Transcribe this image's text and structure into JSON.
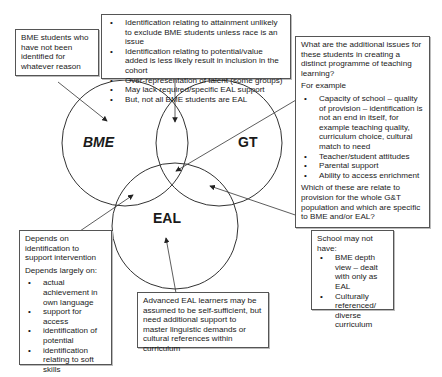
{
  "venn": {
    "circles": [
      {
        "id": "bme",
        "label": "BME",
        "italic": true
      },
      {
        "id": "gt",
        "label": "GT",
        "italic": false
      },
      {
        "id": "eal",
        "label": "EAL",
        "italic": false
      }
    ]
  },
  "boxes": {
    "top_left": {
      "text": "BME students who have not been identified for whatever reason"
    },
    "top_center": {
      "bullets": [
        "Identification relating to attainment unlikely to exclude BME students unless race is an issue",
        "Identification relating to potential/value added is less likely result in inclusion in the cohort",
        "Over-representation of talent (some groups)",
        "May lack required/specific EAL support",
        "But, not all BME students are EAL"
      ]
    },
    "right": {
      "intro": "What are the additional issues for these students in creating a distinct programme of teaching learning?",
      "example_label": "For example",
      "bullets": [
        "Capacity of school – quality of provision – identification is not an end in itself, for example teaching quality, curriculum choice, cultural match to need",
        "Teacher/student attitudes",
        "Parental support",
        "Ability to access enrichment"
      ],
      "closing": "Which of these are relate to provision for the whole G&T population and which are specific to BME and/or EAL?"
    },
    "bottom_left": {
      "intro": "Depends on identification to support intervention",
      "sub": "Depends largely on:",
      "bullets": [
        "actual achievement in own language",
        "support for access",
        "identification of potential",
        "identification relating to soft skills"
      ]
    },
    "bottom_center": {
      "text": "Advanced EAL learners may be assumed to be self-sufficient, but need additional support to master linguistic demands or cultural references within curriculum"
    },
    "bottom_right": {
      "intro": "School may not have:",
      "bullets": [
        "BME depth view – dealt with only as EAL",
        "Culturally referenced/ diverse curriculum"
      ]
    }
  }
}
